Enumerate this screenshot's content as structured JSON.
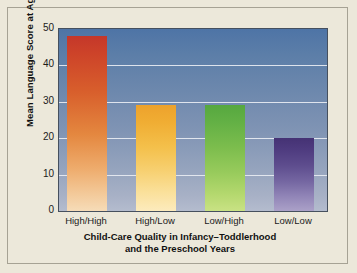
{
  "chart_data": {
    "type": "bar",
    "title": "",
    "categories": [
      "High/High",
      "High/Low",
      "Low/High",
      "Low/Low"
    ],
    "values": [
      48,
      29,
      29,
      20
    ],
    "xlabel_line1": "Child-Care Quality in Infancy–Toddlerhood",
    "xlabel_line2": "and the Preschool Years",
    "ylabel": "Mean Language Score at Age 5",
    "ylim": [
      0,
      50
    ],
    "yticks": [
      50,
      40,
      30,
      20,
      10,
      0
    ],
    "ytick_labels": [
      "50",
      "40",
      "30",
      "20",
      "10",
      "0"
    ],
    "gridlines": [
      10,
      20,
      30,
      40
    ],
    "grid": true,
    "legend": "none",
    "bar_colors": [
      "#c4372a",
      "#eda22c",
      "#56a83f",
      "#453274"
    ],
    "bar_color_bottoms": [
      "#f6dcb8",
      "#fcebbd",
      "#c9e284",
      "#aba1c8"
    ],
    "plot_background_top": "#4e74a6",
    "plot_background_bottom": "#b4bcce",
    "gridline_color": "#e8ecf2",
    "figure_background": "#ece8da",
    "frame_border_color": "#a6a294"
  }
}
